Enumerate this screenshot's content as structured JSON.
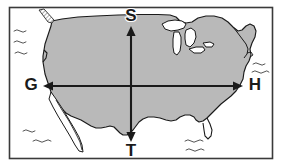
{
  "figure": {
    "kind": "map-diagram",
    "border_color": "#3a3a3a",
    "background_color": "#ffffff",
    "land_fill_color": "#b9b9b9",
    "land_outline_color": "#1a1a1a",
    "water_fill_color": "#ffffff",
    "arrow_color": "#1a1a1a",
    "label_color": "#1a1a1a"
  },
  "labels": {
    "north": "S",
    "south": "T",
    "west": "G",
    "east": "H"
  },
  "arrows": {
    "vertical": {
      "name": "vertical-double-arrow",
      "top_label": "S",
      "bottom_label": "T"
    },
    "horizontal": {
      "name": "horizontal-double-arrow",
      "left_label": "G",
      "right_label": "H"
    }
  },
  "map_features": {
    "land": "contiguous-united-states",
    "lakes": "great-lakes",
    "peninsula": "baja-california",
    "island": "vancouver-island",
    "wave_groups": [
      {
        "name": "pacific-waves",
        "count": 3
      },
      {
        "name": "southwest-pacific-waves",
        "count": 2
      },
      {
        "name": "atlantic-waves",
        "count": 2
      },
      {
        "name": "gulf-of-mexico-waves",
        "count": 3
      }
    ]
  }
}
